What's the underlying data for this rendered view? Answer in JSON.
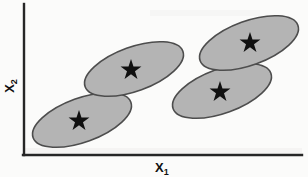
{
  "figure": {
    "type": "scatter-cluster-diagram",
    "title": "",
    "background_color": "#fbfbfa"
  },
  "axes": {
    "x": {
      "label": "X",
      "subscript": "1",
      "label_full": "X1",
      "color": "#262626",
      "start_x": 24,
      "end_x": 302,
      "y": 155
    },
    "y": {
      "label": "X",
      "subscript": "2",
      "label_full": "X2",
      "color": "#262626",
      "x": 24,
      "start_y": 4,
      "end_y": 155
    }
  },
  "chart_data": {
    "type": "scatter",
    "title": "",
    "xlabel": "X1",
    "ylabel": "X2",
    "grid": false,
    "legend": null,
    "clusters": [
      {
        "name": "cluster-1",
        "cx": 82,
        "cy": 120,
        "rx": 52,
        "ry": 22,
        "rotation": -20,
        "fill": "#b4b4b4",
        "stroke": "#4d4d4d",
        "centroid": {
          "x": 79,
          "y": 121,
          "size": 11,
          "marker": "star"
        }
      },
      {
        "name": "cluster-2",
        "cx": 134,
        "cy": 69,
        "rx": 52,
        "ry": 22,
        "rotation": -20,
        "fill": "#b4b4b4",
        "stroke": "#4d4d4d",
        "centroid": {
          "x": 131,
          "y": 70,
          "size": 11,
          "marker": "star"
        }
      },
      {
        "name": "cluster-3",
        "cx": 222,
        "cy": 91,
        "rx": 52,
        "ry": 22,
        "rotation": -20,
        "fill": "#b4b4b4",
        "stroke": "#4d4d4d",
        "centroid": {
          "x": 220,
          "y": 92,
          "size": 11,
          "marker": "star"
        }
      },
      {
        "name": "cluster-4",
        "cx": 249,
        "cy": 43,
        "rx": 52,
        "ry": 22,
        "rotation": -20,
        "fill": "#b4b4b4",
        "stroke": "#4d4d4d",
        "centroid": {
          "x": 250,
          "y": 43,
          "size": 11,
          "marker": "star"
        }
      }
    ]
  },
  "colors": {
    "ellipse_fill": "#b4b4b4",
    "ellipse_stroke": "#4d4d4d",
    "star_fill": "#101010",
    "axis": "#262626"
  }
}
